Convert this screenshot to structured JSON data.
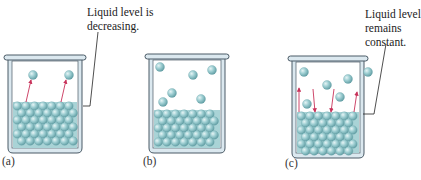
{
  "figure": {
    "panels": [
      {
        "id": "a",
        "label": "(a)",
        "callout": "Liquid level is\ndecreasing.",
        "vapor_molecules": 2,
        "arrows": [
          {
            "direction": "up"
          },
          {
            "direction": "up"
          }
        ]
      },
      {
        "id": "b",
        "label": "(b)",
        "callout": "",
        "vapor_molecules": 6,
        "arrows": []
      },
      {
        "id": "c",
        "label": "(c)",
        "callout": "Liquid level\nremains\nconstant.",
        "vapor_molecules": 6,
        "arrows": [
          {
            "direction": "up"
          },
          {
            "direction": "down"
          },
          {
            "direction": "down"
          },
          {
            "direction": "up"
          }
        ]
      }
    ],
    "colors": {
      "molecule": "#8fc3c8",
      "molecule_highlight": "#d8eef0",
      "molecule_shadow": "#5e9aa0",
      "beaker_outline": "#4a5a66",
      "beaker_glass": "#dbe8ef",
      "arrow": "#c8325a",
      "leader_line": "#222222"
    }
  }
}
